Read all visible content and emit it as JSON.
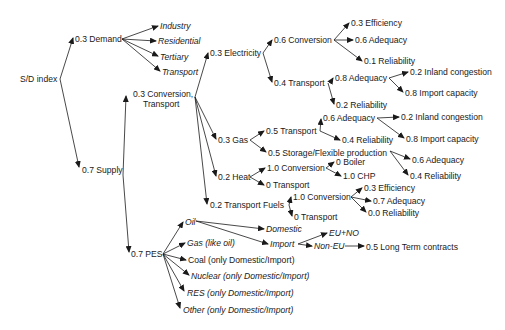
{
  "diagram": {
    "title": "S/D index",
    "nodes": {
      "root": "S/D index",
      "demand": "0.3 Demand",
      "industry": "Industry",
      "residential": "Residential",
      "tertiary": "Tertiary",
      "transport_d": "Transport",
      "conv_transport_1": "0.3 Conversion,",
      "conv_transport_2": "Transport",
      "supply": "0.7 Supply",
      "electricity": "0.3 Electricity",
      "el_conversion": "0.6 Conversion",
      "el_conv_eff": "0.3 Efficiency",
      "el_conv_adeq": "0.6 Adequacy",
      "el_conv_rel": "0.1 Reliability",
      "el_transport": "0.4 Transport",
      "el_tr_adeq": "0.8 Adequacy",
      "el_tr_adeq_inland": "0.2 Inland congestion",
      "el_tr_adeq_import": "0.8 Import capacity",
      "el_tr_rel": "0.2 Reliability",
      "gas": "0.3 Gas",
      "gas_transport": "0.5 Transport",
      "gas_tr_adeq": "0.6 Adequacy",
      "gas_tr_adeq_inland": "0.2  Inland congestion",
      "gas_tr_rel": "0.4 Reliability",
      "gas_tr_import": "0.8 Import capacity",
      "gas_storage": "0.5 Storage/Flexible production",
      "gas_st_adeq": "0.6 Adequacy",
      "gas_st_rel": "0.4 Reliability",
      "heat": "0.2 Heat",
      "heat_conversion": "1.0 Conversion",
      "heat_boiler": "0 Boiler",
      "heat_chp": "1.0 CHP",
      "heat_transport": "0 Transport",
      "tfuels": "0.2 Transport Fuels",
      "tf_conversion": "1.0 Conversion",
      "tf_eff": "0.3 Efficiency",
      "tf_adeq": "0.7 Adequacy",
      "tf_rel": "0.0 Reliability",
      "tf_transport": "0 Transport",
      "pes": "0.7 PES",
      "oil": "Oil",
      "gas_pes": "Gas (like oil)",
      "coal": "Coal  (only Domestic/Import)",
      "nuclear": "Nuclear (only Domestic/Import)",
      "res": "RES (only Domestic/Import)",
      "other": "Other (only Domestic/Import)",
      "domestic": "Domestic",
      "import": "Import",
      "eu_no": "EU+NO",
      "non_eu": "Non-EU",
      "long_term": "0.5 Long Term contracts"
    },
    "colors": {
      "text": "#1a1a1a",
      "line": "#1a1a1a",
      "background": "#ffffff"
    }
  }
}
